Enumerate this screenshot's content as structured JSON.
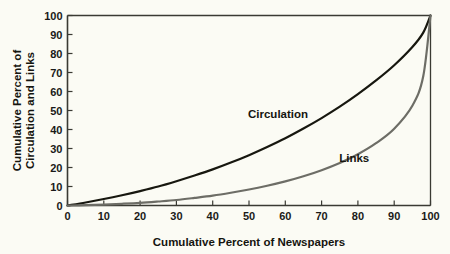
{
  "figure": {
    "background_color": "#fbfbf4",
    "axis_color": "#3a3a33"
  },
  "chart_data": {
    "type": "line",
    "title": "",
    "subtitle": "",
    "xlabel": "Cumulative Percent of Newspapers",
    "ylabel": "Cumulative Percent of Circulation and Links",
    "ylabel_lines": [
      "Cumulative Percent of",
      "Circulation and Links"
    ],
    "xlim": [
      0,
      100
    ],
    "ylim": [
      0,
      100
    ],
    "xticks": [
      0,
      10,
      20,
      30,
      40,
      50,
      60,
      70,
      80,
      90,
      100
    ],
    "yticks": [
      0,
      10,
      20,
      30,
      40,
      50,
      60,
      70,
      80,
      90,
      100
    ],
    "xtick_labels": [
      "0",
      "10",
      "20",
      "30",
      "40",
      "50",
      "60",
      "70",
      "80",
      "90",
      "100"
    ],
    "ytick_labels": [
      "0",
      "10",
      "20",
      "30",
      "40",
      "50",
      "60",
      "70",
      "80",
      "90",
      "100"
    ],
    "grid": false,
    "legend_position": "inline-annotation",
    "x": [
      0,
      5,
      10,
      15,
      20,
      25,
      30,
      35,
      40,
      45,
      50,
      55,
      60,
      65,
      70,
      75,
      80,
      85,
      90,
      95,
      98,
      100
    ],
    "series": [
      {
        "name": "Circulation",
        "color": "#17170f",
        "line_width": 2.2,
        "label_x": 58,
        "label_y": 46,
        "values": [
          0,
          1.6,
          3.4,
          5.4,
          7.6,
          10.0,
          12.8,
          15.8,
          19.0,
          22.6,
          26.5,
          30.8,
          35.4,
          40.5,
          46.0,
          52.0,
          58.6,
          65.8,
          73.8,
          83.4,
          91.0,
          100
        ]
      },
      {
        "name": "Links",
        "color": "#6d6d66",
        "line_width": 2.2,
        "label_x": 79,
        "label_y": 23,
        "values": [
          0,
          0.2,
          0.5,
          0.9,
          1.4,
          2.1,
          2.9,
          4.0,
          5.2,
          6.7,
          8.4,
          10.4,
          12.7,
          15.4,
          18.6,
          22.4,
          27.0,
          32.8,
          40.4,
          52.5,
          68.0,
          100
        ]
      }
    ],
    "annotations": [
      {
        "text": "Circulation",
        "x": 58,
        "y": 46
      },
      {
        "text": "Links",
        "x": 79,
        "y": 23
      }
    ]
  }
}
